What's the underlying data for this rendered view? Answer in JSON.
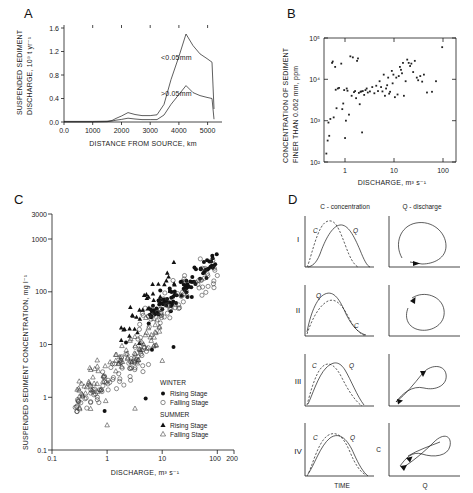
{
  "figure": {
    "panels": [
      "A",
      "B",
      "C",
      "D"
    ]
  },
  "panelA": {
    "label": "A",
    "ylabel_line1": "SUSPENDED SEDIMENT",
    "ylabel_line2": "DISCHARGE, 10⁹ t yr⁻¹",
    "xlabel": "DISTANCE FROM SOURCE, km",
    "yticks": [
      "0.0",
      "0.4",
      "0.8",
      "1.2",
      "1.6"
    ],
    "xticks": [
      "0.0",
      "1000",
      "2000",
      "3000",
      "4000",
      "5000"
    ],
    "annotation_fine": "<0.05mm",
    "annotation_coarse": ">0.05mm"
  },
  "panelB": {
    "label": "B",
    "ylabel_line1": "CONCENTRATION OF SEDIMENT",
    "ylabel_line2": "FINER THAN 0.062 mm, ppm",
    "xlabel": "DISCHARGE, m³ s⁻¹",
    "yticks": [
      "10²",
      "10³",
      "10⁴",
      "10⁵"
    ],
    "xticks": [
      "1",
      "10",
      "100"
    ]
  },
  "panelC": {
    "label": "C",
    "ylabel": "SUSPENDED SEDIMENT CONCENTRATION, mg l⁻¹",
    "xlabel": "DISCHARGE, m³ s⁻¹",
    "yticks": [
      "0.1",
      "1",
      "10",
      "100",
      "1000",
      "3000"
    ],
    "xticks": [
      "0.1",
      "1",
      "10",
      "100",
      "200"
    ],
    "legend": {
      "group1_title": "WINTER",
      "group1_item1": "Rising Stage",
      "group1_item2": "Falling Stage",
      "group2_title": "SUMMER",
      "group2_item1": "Rising Stage",
      "group2_item2": "Falling Stage"
    }
  },
  "panelD": {
    "label": "D",
    "col1_caption": "C - concentration",
    "col2_caption": "Q - discharge",
    "xlabel_left": "TIME",
    "xlabel_right": "Q",
    "ylabel_right": "C",
    "rows": [
      {
        "numeral": "I",
        "curve_label_c": "C",
        "curve_label_q": "Q"
      },
      {
        "numeral": "II",
        "curve_label_c": "C",
        "curve_label_q": "Q"
      },
      {
        "numeral": "III",
        "curve_label_c": "C",
        "curve_label_q": "Q"
      },
      {
        "numeral": "IV",
        "curve_label_c": "C",
        "curve_label_q": "Q"
      }
    ]
  },
  "chart_data": [
    {
      "panel": "A",
      "type": "line",
      "title": "",
      "xlabel": "DISTANCE FROM SOURCE, km",
      "ylabel": "SUSPENDED SEDIMENT DISCHARGE, 10^9 t yr^-1",
      "xlim": [
        0,
        5500
      ],
      "ylim": [
        0,
        1.6
      ],
      "grid": false,
      "series": [
        {
          "name": "<0.05mm",
          "x": [
            0,
            500,
            1000,
            1500,
            1800,
            2100,
            2400,
            2600,
            2900,
            3200,
            3400,
            3600,
            3900,
            4200,
            4450,
            4700,
            5000,
            5200,
            5350,
            5400
          ],
          "y": [
            0.01,
            0.01,
            0.01,
            0.02,
            0.06,
            0.1,
            0.16,
            0.13,
            0.11,
            0.11,
            0.12,
            0.3,
            0.72,
            1.12,
            1.49,
            1.3,
            1.16,
            1.08,
            1.02,
            0.2
          ]
        },
        {
          "name": ">0.05mm",
          "x": [
            0,
            500,
            1000,
            1500,
            1800,
            2100,
            2400,
            2600,
            2900,
            3200,
            3400,
            3600,
            3900,
            4200,
            4450,
            4700,
            5000,
            5200,
            5350,
            5400
          ],
          "y": [
            0.0,
            0.0,
            0.0,
            0.01,
            0.02,
            0.03,
            0.05,
            0.04,
            0.03,
            0.03,
            0.03,
            0.12,
            0.3,
            0.47,
            0.62,
            0.5,
            0.45,
            0.42,
            0.4,
            0.05
          ]
        }
      ]
    },
    {
      "panel": "B",
      "type": "scatter",
      "xlabel": "DISCHARGE, m^3 s^-1",
      "ylabel": "CONCENTRATION OF SEDIMENT FINER THAN 0.062 mm, ppm",
      "xlim": [
        0.4,
        300
      ],
      "ylim": [
        100,
        100000
      ],
      "xscale": "log",
      "yscale": "log",
      "grid": false,
      "points": [
        [
          0.45,
          160
        ],
        [
          0.48,
          330
        ],
        [
          0.52,
          430
        ],
        [
          0.55,
          1100
        ],
        [
          0.5,
          900
        ],
        [
          0.6,
          25000
        ],
        [
          0.62,
          27000
        ],
        [
          0.7,
          20000
        ],
        [
          0.72,
          5600
        ],
        [
          0.75,
          2000
        ],
        [
          0.8,
          6000
        ],
        [
          0.85,
          6200
        ],
        [
          0.95,
          24000
        ],
        [
          1.0,
          1900
        ],
        [
          1.1,
          5500
        ],
        [
          1.15,
          380
        ],
        [
          1.2,
          1000
        ],
        [
          1.25,
          6000
        ],
        [
          1.3,
          5300
        ],
        [
          1.4,
          1400
        ],
        [
          1.5,
          36000
        ],
        [
          1.6,
          4000
        ],
        [
          1.7,
          34000
        ],
        [
          1.8,
          4900
        ],
        [
          1.9,
          5200
        ],
        [
          2.0,
          3500
        ],
        [
          2.1,
          28000
        ],
        [
          2.2,
          32000
        ],
        [
          2.3,
          4700
        ],
        [
          2.5,
          5000
        ],
        [
          2.6,
          5100
        ],
        [
          2.7,
          520
        ],
        [
          2.8,
          5200
        ],
        [
          3.0,
          4200
        ],
        [
          3.2,
          5500
        ],
        [
          3.4,
          6000
        ],
        [
          3.6,
          4800
        ],
        [
          4.0,
          5100
        ],
        [
          4.5,
          6500
        ],
        [
          5.0,
          4600
        ],
        [
          5.5,
          7000
        ],
        [
          6.0,
          5200
        ],
        [
          6.5,
          9000
        ],
        [
          7.0,
          6500
        ],
        [
          7.5,
          5100
        ],
        [
          8.0,
          13000
        ],
        [
          8.5,
          4000
        ],
        [
          9.0,
          6000
        ],
        [
          9.5,
          7200
        ],
        [
          10,
          11000
        ],
        [
          10.5,
          4500
        ],
        [
          11,
          5000
        ],
        [
          12,
          16000
        ],
        [
          12.5,
          8000
        ],
        [
          13,
          13000
        ],
        [
          14,
          3700
        ],
        [
          15,
          11000
        ],
        [
          16,
          4300
        ],
        [
          17,
          12000
        ],
        [
          18,
          20000
        ],
        [
          19,
          17000
        ],
        [
          20,
          14000
        ],
        [
          21,
          25000
        ],
        [
          22,
          4000
        ],
        [
          24,
          9000
        ],
        [
          26,
          30000
        ],
        [
          28,
          25000
        ],
        [
          30,
          21000
        ],
        [
          32,
          24000
        ],
        [
          35,
          15000
        ],
        [
          38,
          28000
        ],
        [
          42,
          11000
        ],
        [
          45,
          9500
        ],
        [
          50,
          12000
        ],
        [
          55,
          8800
        ],
        [
          60,
          13000
        ],
        [
          70,
          4800
        ],
        [
          90,
          5000
        ],
        [
          110,
          9000
        ],
        [
          150,
          60000
        ],
        [
          1.05,
          2600
        ],
        [
          2.4,
          2500
        ],
        [
          0.65,
          1200
        ]
      ]
    },
    {
      "panel": "C",
      "type": "scatter",
      "xlabel": "DISCHARGE, m^3 s^-1",
      "ylabel": "SUSPENDED SEDIMENT CONCENTRATION, mg l^-1",
      "xlim": [
        0.1,
        200
      ],
      "ylim": [
        0.1,
        3000
      ],
      "xscale": "log",
      "yscale": "log",
      "grid": false,
      "series": [
        {
          "name": "WINTER Rising Stage",
          "marker": "filled-circle"
        },
        {
          "name": "WINTER Falling Stage",
          "marker": "open-circle"
        },
        {
          "name": "SUMMER Rising Stage",
          "marker": "filled-triangle"
        },
        {
          "name": "SUMMER Falling Stage",
          "marker": "open-triangle"
        }
      ]
    },
    {
      "panel": "D",
      "type": "line",
      "xlabel": "TIME / Q",
      "ylabel": "C",
      "note": "Four schematic hysteresis types I-IV: C and Q hydrograph shapes (left) and corresponding C-Q loops (right)"
    }
  ]
}
